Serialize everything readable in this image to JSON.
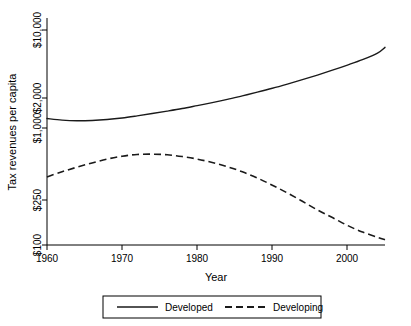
{
  "chart_data": {
    "type": "line",
    "title": "",
    "xlabel": "Year",
    "ylabel": "Tax revenues per capita",
    "yscale": "log",
    "xlim": [
      1960,
      2005
    ],
    "ylim": [
      100,
      10000
    ],
    "grid": false,
    "legend_position": "bottom",
    "xticks": [
      1960,
      1970,
      1980,
      1990,
      2000
    ],
    "xtick_labels": [
      "1960",
      "1970",
      "1980",
      "1990",
      "2000"
    ],
    "yticks": [
      100,
      250,
      1000,
      2000,
      10000
    ],
    "ytick_labels": [
      "$100",
      "$250",
      "$1,000",
      "$2,000",
      "$10,000"
    ],
    "x": [
      1960,
      1962,
      1964,
      1966,
      1968,
      1970,
      1972,
      1974,
      1976,
      1978,
      1980,
      1982,
      1984,
      1986,
      1988,
      1990,
      1992,
      1994,
      1996,
      1998,
      2000,
      2002,
      2004,
      2005
    ],
    "series": [
      {
        "name": "Developed",
        "style": "solid",
        "color": "#1a1a1a",
        "values": [
          1500,
          1450,
          1430,
          1440,
          1470,
          1520,
          1590,
          1670,
          1760,
          1860,
          1980,
          2110,
          2260,
          2440,
          2640,
          2870,
          3140,
          3450,
          3810,
          4230,
          4720,
          5300,
          6100,
          6900
        ]
      },
      {
        "name": "Developing",
        "style": "dashed",
        "color": "#1a1a1a",
        "values": [
          430,
          480,
          530,
          580,
          630,
          670,
          695,
          700,
          690,
          665,
          630,
          585,
          535,
          480,
          420,
          360,
          305,
          255,
          212,
          180,
          152,
          132,
          118,
          112
        ]
      }
    ],
    "legend": [
      {
        "label": "Developed",
        "style": "solid"
      },
      {
        "label": "Developing",
        "style": "dashed"
      }
    ]
  },
  "axes": {
    "x_title": "Year",
    "y_title": "Tax revenues per capita"
  }
}
